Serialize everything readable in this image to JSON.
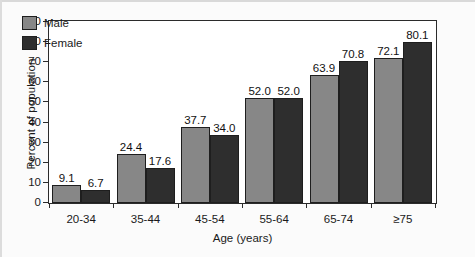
{
  "chart_data": {
    "type": "bar",
    "title": "",
    "xlabel": "Age (years)",
    "ylabel": "Percent of population",
    "categories": [
      "20-34",
      "35-44",
      "45-54",
      "55-64",
      "65-74",
      "≥75"
    ],
    "series": [
      {
        "name": "Male",
        "color": "#878787",
        "values": [
          9.1,
          24.4,
          37.7,
          52.0,
          63.9,
          72.1
        ]
      },
      {
        "name": "Female",
        "color": "#2e2e2e",
        "values": [
          6.7,
          17.6,
          34.0,
          52.0,
          70.8,
          80.1
        ]
      }
    ],
    "value_labels": {
      "Male": [
        "9.1",
        "24.4",
        "37.7",
        "52.0",
        "63.9",
        "72.1"
      ],
      "Female": [
        "6.7",
        "17.6",
        "34.0",
        "52.0",
        "70.8",
        "80.1"
      ]
    },
    "ylim": [
      0,
      90
    ],
    "yticks": [
      0,
      10,
      20,
      30,
      40,
      50,
      60,
      70,
      80,
      90
    ],
    "ytick_labels": [
      "0",
      "10",
      "20",
      "30",
      "40",
      "50",
      "60",
      "70",
      "80",
      "90"
    ],
    "grid": false,
    "legend_position": "top-left",
    "legend": [
      "Male",
      "Female"
    ]
  },
  "axes": {
    "y_title": "Percent of population",
    "x_title": "Age (years)"
  },
  "legend": {
    "male_label": "Male",
    "female_label": "Female"
  }
}
